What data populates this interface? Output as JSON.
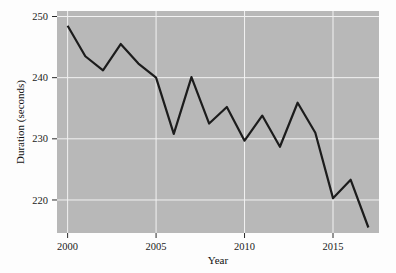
{
  "chart_data": {
    "type": "line",
    "title": "",
    "xlabel": "Year",
    "ylabel": "Duration (seconds)",
    "xlim": [
      1999.4,
      2017.6
    ],
    "ylim": [
      214.6,
      250.9
    ],
    "grid": true,
    "legend": "none",
    "x": [
      2000,
      2001,
      2002,
      2003,
      2004,
      2005,
      2006,
      2007,
      2008,
      2009,
      2010,
      2011,
      2012,
      2013,
      2014,
      2015,
      2016,
      2017
    ],
    "values": [
      248.5,
      243.5,
      241.2,
      245.5,
      242.3,
      240.0,
      230.8,
      240.1,
      232.5,
      235.2,
      229.7,
      233.8,
      228.7,
      235.9,
      231.0,
      220.3,
      223.3,
      215.5
    ],
    "series": [
      {
        "name": "Duration",
        "values": [
          248.5,
          243.5,
          241.2,
          245.5,
          242.3,
          240.0,
          230.8,
          240.1,
          232.5,
          235.2,
          229.7,
          233.8,
          228.7,
          235.9,
          231.0,
          220.3,
          223.3,
          215.5
        ]
      }
    ],
    "xticks": [
      2000,
      2005,
      2010,
      2015
    ],
    "xtick_labels": [
      "2000",
      "2005",
      "2010",
      "2015"
    ],
    "yticks": [
      220,
      230,
      240,
      250
    ],
    "ytick_labels": [
      "220",
      "230",
      "240",
      "250"
    ],
    "x_gridlines": [
      2000,
      2005,
      2010,
      2015
    ],
    "y_gridlines": [
      220,
      230,
      240,
      250
    ],
    "colors": {
      "line": "#1c1c1c",
      "plot_background": "#b8b8b8",
      "gridline": "#f2f2f2",
      "figure_background": "#fdfdfd",
      "axis_text": "#1a1a1a"
    },
    "line_width": 2.2
  },
  "axis": {
    "y_title": "Duration (seconds)",
    "x_title": "Year"
  }
}
